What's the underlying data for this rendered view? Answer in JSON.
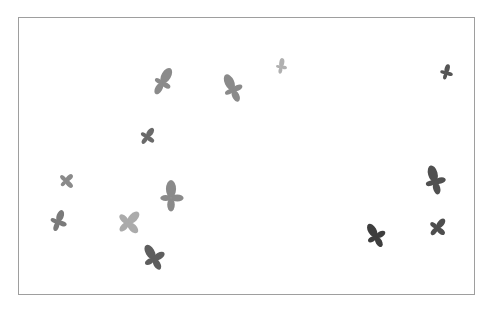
{
  "frame": {
    "x": 18,
    "y": 17,
    "width": 457,
    "height": 278,
    "border_color": "#9e9e9e"
  },
  "shapes": [
    {
      "id": "s1",
      "cx": 162,
      "cy": 83,
      "size": 34,
      "rot": 30,
      "color": "#8a8a8a",
      "a": 1.0,
      "b": 0.55
    },
    {
      "id": "s2",
      "cx": 233,
      "cy": 90,
      "size": 34,
      "rot": -25,
      "color": "#8a8a8a",
      "a": 1.0,
      "b": 0.6
    },
    {
      "id": "s3",
      "cx": 281,
      "cy": 67,
      "size": 20,
      "rot": 10,
      "color": "#b0b0b0",
      "a": 0.9,
      "b": 0.6
    },
    {
      "id": "s4",
      "cx": 446,
      "cy": 73,
      "size": 20,
      "rot": 15,
      "color": "#555555",
      "a": 0.9,
      "b": 0.7
    },
    {
      "id": "s5",
      "cx": 147,
      "cy": 137,
      "size": 24,
      "rot": 35,
      "color": "#6a6a6a",
      "a": 0.9,
      "b": 0.7
    },
    {
      "id": "s6",
      "cx": 66,
      "cy": 181,
      "size": 20,
      "rot": 45,
      "color": "#8a8a8a",
      "a": 0.9,
      "b": 0.9
    },
    {
      "id": "s7",
      "cx": 171,
      "cy": 198,
      "size": 36,
      "rot": 0,
      "color": "#8a8a8a",
      "a": 1.0,
      "b": 0.7
    },
    {
      "id": "s8",
      "cx": 58,
      "cy": 222,
      "size": 28,
      "rot": 20,
      "color": "#7a7a7a",
      "a": 0.9,
      "b": 0.65
    },
    {
      "id": "s9",
      "cx": 128,
      "cy": 223,
      "size": 30,
      "rot": 45,
      "color": "#ababab",
      "a": 1.0,
      "b": 0.9
    },
    {
      "id": "s10",
      "cx": 154,
      "cy": 259,
      "size": 32,
      "rot": -30,
      "color": "#5e5e5e",
      "a": 1.0,
      "b": 0.75
    },
    {
      "id": "s11",
      "cx": 435,
      "cy": 182,
      "size": 34,
      "rot": -15,
      "color": "#505050",
      "a": 1.0,
      "b": 0.65
    },
    {
      "id": "s12",
      "cx": 376,
      "cy": 237,
      "size": 30,
      "rot": -30,
      "color": "#3e3e3e",
      "a": 1.0,
      "b": 0.7
    },
    {
      "id": "s13",
      "cx": 437,
      "cy": 228,
      "size": 26,
      "rot": 40,
      "color": "#4e4e4e",
      "a": 0.9,
      "b": 0.75
    }
  ]
}
